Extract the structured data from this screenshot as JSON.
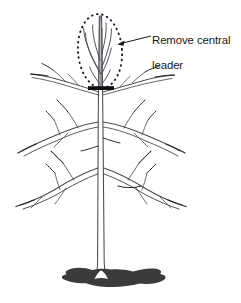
{
  "figure": {
    "name": "pruning-diagram-remove-central-leader",
    "background_color": "#ffffff",
    "line_color": "#4a4a52",
    "dark_ink_color": "#17171a",
    "soil_color": "#3b3b3d",
    "width": 241,
    "height": 303
  },
  "annotation": {
    "label_line1": "Remove central",
    "label_line2": "leader",
    "label_full": "Remove central leader",
    "text_color": "#18181a",
    "font_size_px": 11.4,
    "leader_line": {
      "from_x": 151,
      "from_y": 36,
      "to_x": 118,
      "to_y": 44,
      "arrowhead": "left"
    }
  },
  "highlight_ellipse": {
    "name": "central-leader-highlight",
    "style": "dotted",
    "center_x": 100,
    "center_y": 51,
    "radius_x": 22,
    "radius_y": 37,
    "rotation_deg": -4,
    "dot_color": "#17171a"
  },
  "cut_mark": {
    "name": "pruning-cut-bar",
    "x_start": 88,
    "x_end": 114,
    "y": 88,
    "thickness": 4,
    "color": "#0f0f11"
  },
  "tree": {
    "trunk": {
      "top_y": 16,
      "base_y": 278,
      "center_x": 101,
      "width_top": 3,
      "width_base": 9
    },
    "branch_whorls": [
      {
        "level": "upper",
        "y": 78,
        "left_reach_x": 28,
        "right_reach_x": 198
      },
      {
        "level": "middle",
        "y": 122,
        "left_reach_x": 14,
        "right_reach_x": 212
      },
      {
        "level": "lower",
        "y": 172,
        "left_reach_x": 12,
        "right_reach_x": 216
      }
    ],
    "leader_shoots_count": 4
  },
  "soil_mound": {
    "name": "soil-mound",
    "x_start": 66,
    "x_end": 164,
    "y_top": 266,
    "y_bottom": 290,
    "color": "#3b3b3d"
  }
}
